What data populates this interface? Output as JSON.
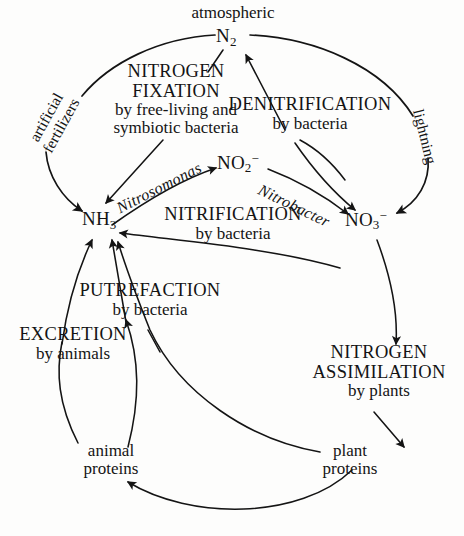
{
  "diagram": {
    "type": "cycle-diagram",
    "ink_color": "#141414",
    "background_color": "#fdfdfc"
  },
  "pools": {
    "atmospheric_label": "atmospheric",
    "n2": {
      "formula": "N",
      "subscript": "2",
      "superscript": ""
    },
    "nh3": {
      "formula": "NH",
      "subscript": "3",
      "superscript": ""
    },
    "no2": {
      "formula": "NO",
      "subscript": "2",
      "superscript": "−"
    },
    "no3": {
      "formula": "NO",
      "subscript": "3",
      "superscript": "−"
    },
    "animal_proteins_line1": "animal",
    "animal_proteins_line2": "proteins",
    "plant_proteins_line1": "plant",
    "plant_proteins_line2": "proteins"
  },
  "processes": {
    "nitrogen_fixation": {
      "line1": "NITROGEN",
      "line2": "FIXATION",
      "line3": "by free-living and",
      "line4": "symbiotic bacteria"
    },
    "denitrification": {
      "line1": "DENITRIFICATION",
      "line2": "by bacteria"
    },
    "nitrification": {
      "line1": "NITRIFICATION",
      "line2": "by bacteria"
    },
    "putrefaction": {
      "line1": "PUTREFACTION",
      "line2": "by bacteria"
    },
    "excretion": {
      "line1": "EXCRETION",
      "line2": "by animals"
    },
    "nitrogen_assimilation": {
      "line1": "NITROGEN",
      "line2": "ASSIMILATION",
      "line3": "by plants"
    }
  },
  "agents": {
    "nitrosomonas": "Nitrosomonas",
    "nitrobacter": "Nitrobacter"
  },
  "fluxes": {
    "artificial_fertilizers_line1": "artificial",
    "artificial_fertilizers_line2": "fertilizers",
    "lightning": "lightning"
  }
}
